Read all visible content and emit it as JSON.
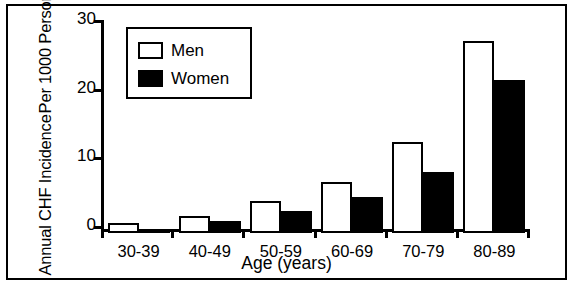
{
  "chart_data": {
    "type": "bar",
    "title": "",
    "xlabel": "Age (years)",
    "ylabel": "Annual CHF Incidence Per 1000 Persons",
    "ylabel_lines": [
      "Annual CHF Incidence",
      "Per 1000 Persons"
    ],
    "categories": [
      "30-39",
      "40-49",
      "50-59",
      "60-69",
      "70-79",
      "80-89"
    ],
    "series": [
      {
        "name": "Men",
        "color": "#ffffff",
        "values": [
          1.5,
          2.5,
          4.7,
          7.4,
          13.3,
          28.0
        ]
      },
      {
        "name": "Women",
        "color": "#000000",
        "values": [
          0.5,
          1.7,
          3.2,
          5.2,
          8.9,
          22.3
        ]
      }
    ],
    "ylim": [
      0,
      30
    ],
    "yticks": [
      0,
      10,
      20,
      30
    ],
    "ytick_labels": [
      "0",
      "10",
      "20",
      "30"
    ],
    "grid": false,
    "legend_position": "upper-left-inside"
  },
  "legend": {
    "entries": [
      {
        "label": "Men"
      },
      {
        "label": "Women"
      }
    ]
  },
  "axes": {
    "y_title_line1": "Annual CHF Incidence",
    "y_title_line2": "Per 1000 Persons",
    "x_title": "Age (years)"
  }
}
